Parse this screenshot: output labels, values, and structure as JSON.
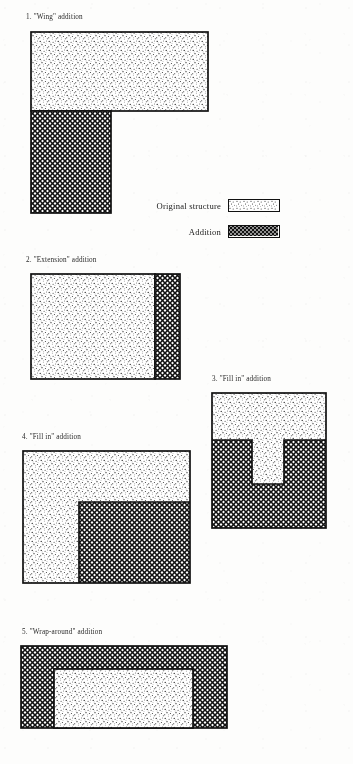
{
  "page": {
    "background_color": "#fdfdfc",
    "ink_color": "#111111"
  },
  "legend": {
    "items": [
      {
        "label": "Original structure",
        "pattern": "stipple",
        "pattern_name": "fine-dot-stipple"
      },
      {
        "label": "Addition",
        "pattern": "crosshatch",
        "pattern_name": "diagonal-crosshatch"
      }
    ]
  },
  "figures": [
    {
      "id": "fig-1",
      "caption": "1. \"Wing\" addition",
      "description": "Wide stippled original block with a tall cross-hatched wing below at the left",
      "parts": [
        {
          "role": "original",
          "pattern": "stipple",
          "x": 0,
          "y": 0,
          "w": 177,
          "h": 79
        },
        {
          "role": "addition",
          "pattern": "crosshatch",
          "x": 0,
          "y": 79,
          "w": 80,
          "h": 102
        }
      ]
    },
    {
      "id": "fig-2",
      "caption": "2. \"Extension\" addition",
      "description": "Large stippled original block with a narrow cross-hatched extension strip on the right",
      "parts": [
        {
          "role": "original",
          "pattern": "stipple",
          "x": 0,
          "y": 0,
          "w": 124,
          "h": 105
        },
        {
          "role": "addition",
          "pattern": "crosshatch",
          "x": 124,
          "y": 0,
          "w": 25,
          "h": 105
        }
      ]
    },
    {
      "id": "fig-3",
      "caption": "3. \"Fill in\" addition",
      "description": "Stippled original in an inverted-T shape, cross-hatched addition filling the two lower side pockets",
      "parts": [
        {
          "role": "original",
          "pattern": "stipple",
          "x": 0,
          "y": 0,
          "w": 114,
          "h": 48
        },
        {
          "role": "original",
          "pattern": "stipple",
          "x": 40,
          "y": 48,
          "w": 32,
          "h": 44
        },
        {
          "role": "addition",
          "pattern": "crosshatch",
          "x": 0,
          "y": 48,
          "w": 40,
          "h": 86
        },
        {
          "role": "addition",
          "pattern": "crosshatch",
          "x": 72,
          "y": 48,
          "w": 42,
          "h": 86
        },
        {
          "role": "addition",
          "pattern": "crosshatch",
          "x": 40,
          "y": 92,
          "w": 32,
          "h": 42
        }
      ]
    },
    {
      "id": "fig-4",
      "caption": "4. \"Fill in\" addition",
      "description": "L-shaped stippled original with cross-hatched addition filling the lower-right corner",
      "parts": [
        {
          "role": "original",
          "pattern": "stipple",
          "x": 0,
          "y": 0,
          "w": 167,
          "h": 51
        },
        {
          "role": "original",
          "pattern": "stipple",
          "x": 0,
          "y": 51,
          "w": 56,
          "h": 81
        },
        {
          "role": "addition",
          "pattern": "crosshatch",
          "x": 56,
          "y": 51,
          "w": 111,
          "h": 81
        }
      ]
    },
    {
      "id": "fig-5",
      "caption": "5. \"Wrap-around\" addition",
      "description": "Cross-hatched addition wrapping around a central stippled original block",
      "parts": [
        {
          "role": "addition",
          "pattern": "crosshatch",
          "x": 0,
          "y": 0,
          "w": 206,
          "h": 79
        },
        {
          "role": "original",
          "pattern": "stipple",
          "x": 33,
          "y": 23,
          "w": 139,
          "h": 56
        }
      ]
    }
  ]
}
